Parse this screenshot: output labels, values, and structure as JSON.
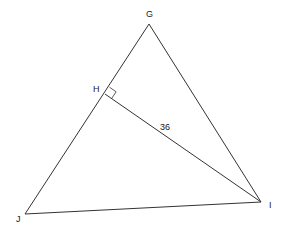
{
  "diagram": {
    "type": "triangle-geometry",
    "points": {
      "G": {
        "label": "G",
        "x": 149,
        "y": 24,
        "label_x": 146,
        "label_y": 17
      },
      "H": {
        "label": "H",
        "x": 105,
        "y": 94,
        "label_x": 93,
        "label_y": 92
      },
      "J": {
        "label": "J",
        "x": 25,
        "y": 214,
        "label_x": 16,
        "label_y": 222
      },
      "I": {
        "label": "I",
        "x": 261,
        "y": 202,
        "label_x": 269,
        "label_y": 208
      }
    },
    "segments": [
      {
        "from": "G",
        "to": "J"
      },
      {
        "from": "G",
        "to": "I"
      },
      {
        "from": "J",
        "to": "I"
      },
      {
        "from": "H",
        "to": "I"
      }
    ],
    "right_angle_at": "H",
    "measure": {
      "segment": "HI",
      "value": "36",
      "label_x": 160,
      "label_y": 130
    },
    "colors": {
      "stroke": "#333333",
      "background": "#ffffff"
    }
  }
}
